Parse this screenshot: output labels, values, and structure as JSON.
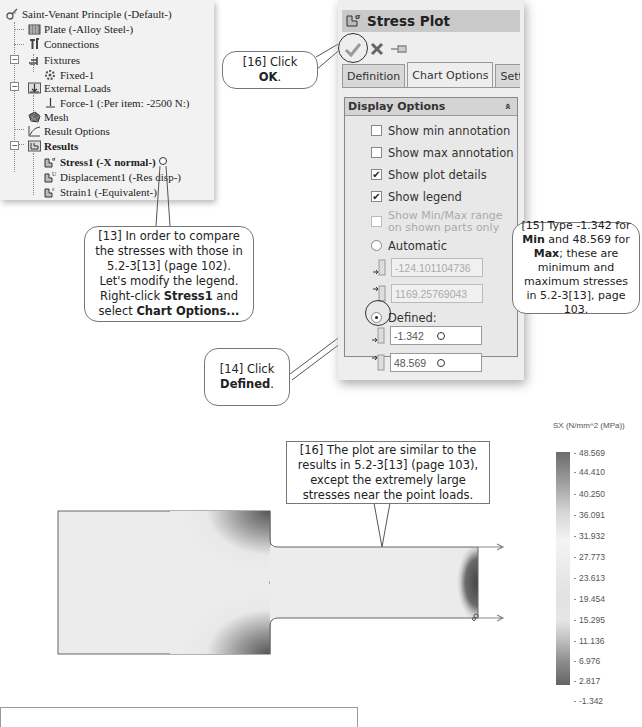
{
  "feature_tree": {
    "items": [
      {
        "label": "Saint-Venant Principle (-Default-)",
        "icon": "study-icon",
        "bold": false
      },
      {
        "label": "Plate (-Alloy Steel-)",
        "icon": "part-icon",
        "bold": false
      },
      {
        "label": "Connections",
        "icon": "connections-icon",
        "bold": false
      },
      {
        "label": "Fixtures",
        "icon": "fixtures-icon",
        "bold": false
      },
      {
        "label": "Fixed-1",
        "icon": "fixed-icon",
        "bold": false
      },
      {
        "label": "External Loads",
        "icon": "external-loads-icon",
        "bold": false
      },
      {
        "label": "Force-1 (:Per item: -2500 N:)",
        "icon": "force-icon",
        "bold": false
      },
      {
        "label": "Mesh",
        "icon": "mesh-icon",
        "bold": false
      },
      {
        "label": "Result Options",
        "icon": "result-options-icon",
        "bold": false
      },
      {
        "label": "Results",
        "icon": "results-folder-icon",
        "bold": true
      },
      {
        "label": "Stress1 (-X normal-)",
        "icon": "stress-plot-icon",
        "bold": true
      },
      {
        "label": "Displacement1 (-Res disp-)",
        "icon": "displacement-plot-icon",
        "bold": false
      },
      {
        "label": "Strain1 (-Equivalent-)",
        "icon": "strain-plot-icon",
        "bold": false
      }
    ]
  },
  "property_manager": {
    "title": "Stress Plot",
    "actions": {
      "ok": "OK",
      "cancel": "Cancel",
      "pin": "Keep Visible"
    },
    "tabs": [
      {
        "label": "Definition",
        "active": false
      },
      {
        "label": "Chart Options",
        "active": true
      },
      {
        "label": "Settings",
        "active": false
      }
    ],
    "display_options": {
      "header": "Display Options",
      "collapse_glyph": "»",
      "show_min_annotation": {
        "label": "Show min annotation",
        "checked": false
      },
      "show_max_annotation": {
        "label": "Show max annotation",
        "checked": false
      },
      "show_plot_details": {
        "label": "Show plot details",
        "checked": true
      },
      "show_legend": {
        "label": "Show legend",
        "checked": true
      },
      "show_minmax_range": {
        "label": "Show Min/Max range on shown parts only",
        "checked": false,
        "disabled": true
      },
      "automatic": {
        "label": "Automatic",
        "selected": false,
        "min": "-124.101104736",
        "max": "1169.25769043"
      },
      "defined": {
        "label": "Defined:",
        "selected": true,
        "min": "-1.342",
        "max": "48.569"
      }
    }
  },
  "callouts": {
    "c13": {
      "prefix": "[13] In order to compare the stresses with those in 5.2-3[13] (page 102).  Let's modify the legend.  Right-click ",
      "bold1": "Stress1",
      "mid": " and select ",
      "bold2": "Chart Options..."
    },
    "c14": {
      "prefix": "[14] Click ",
      "bold": "Defined",
      "suffix": "."
    },
    "c15": {
      "prefix": "[15] Type -1.342 for ",
      "bold1": "Min",
      "mid": " and 48.569 for ",
      "bold2": "Max",
      "suffix": "; these are minimum and maximum stresses in 5.2-3[13], page 103."
    },
    "c16_ok": {
      "prefix": "[16] Click ",
      "bold": "OK",
      "suffix": "."
    },
    "c16_plot": {
      "text": "[16] The plot are similar to the results in 5.2-3[13] (page 103), except the extremely large stresses near the point loads."
    }
  },
  "plot": {
    "legend_title": "SX (N/mm^2 (MPa))",
    "legend_values": [
      "48.569",
      "44.410",
      "40.250",
      "36.091",
      "31.932",
      "27.773",
      "23.613",
      "19.454",
      "15.295",
      "11.136",
      "6.976",
      "2.817",
      "-1.342"
    ]
  }
}
